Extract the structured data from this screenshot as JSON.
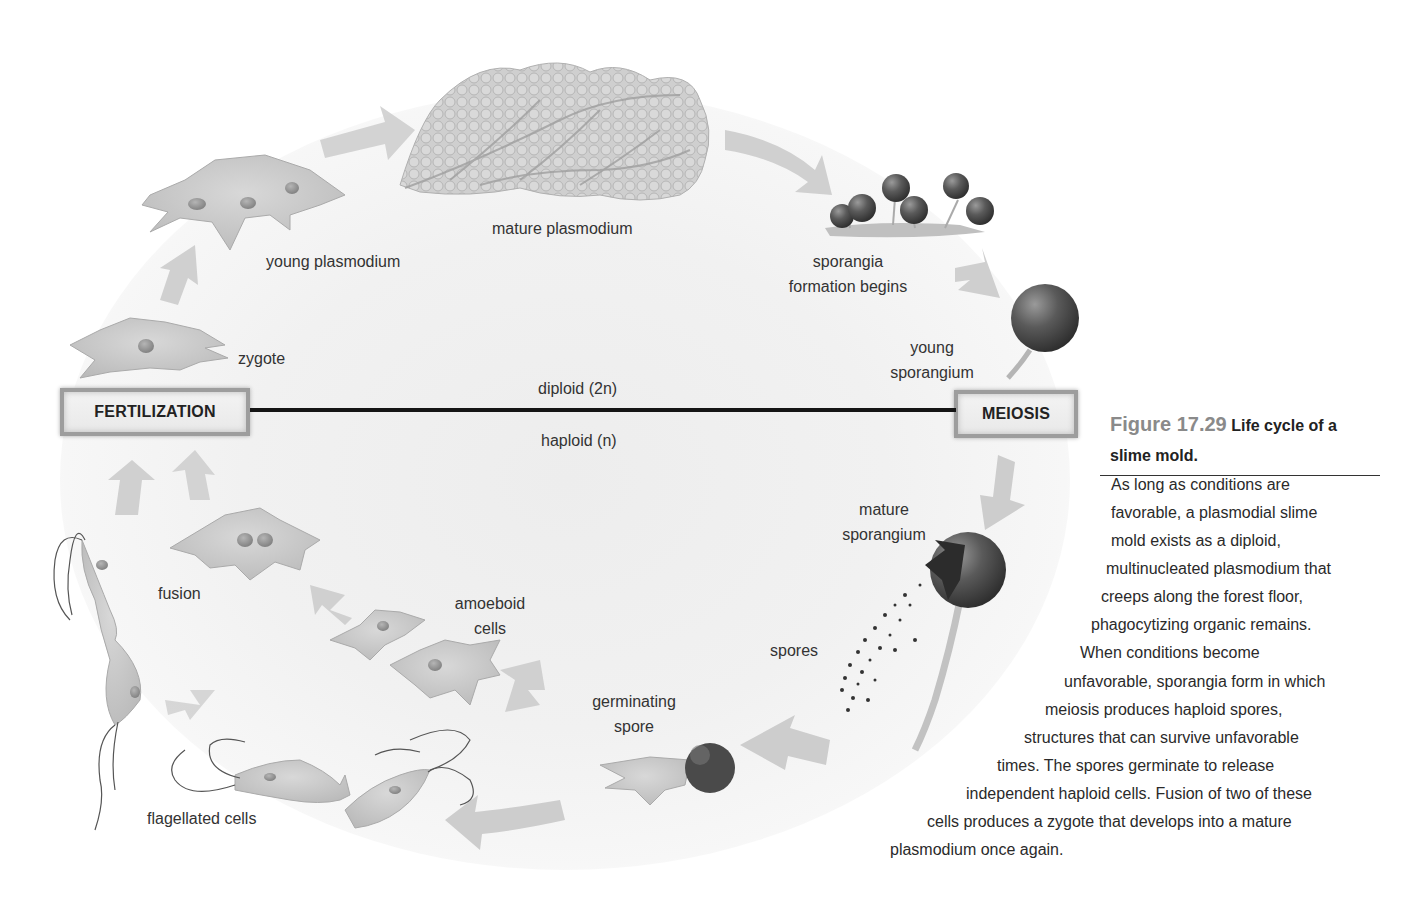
{
  "diagram": {
    "stages": {
      "fertilization": "FERTILIZATION",
      "meiosis": "MEIOSIS"
    },
    "ploidy": {
      "diploid": "diploid (2n)",
      "haploid": "haploid (n)"
    },
    "labels": {
      "young_plasmodium": "young plasmodium",
      "mature_plasmodium": "mature plasmodium",
      "sporangia_formation_1": "sporangia",
      "sporangia_formation_2": "formation begins",
      "young_sporangium_1": "young",
      "young_sporangium_2": "sporangium",
      "zygote": "zygote",
      "mature_sporangium_1": "mature",
      "mature_sporangium_2": "sporangium",
      "spores": "spores",
      "germinating_spore_1": "germinating",
      "germinating_spore_2": "spore",
      "amoeboid_cells_1": "amoeboid",
      "amoeboid_cells_2": "cells",
      "fusion": "fusion",
      "flagellated_cells": "flagellated cells"
    },
    "colors": {
      "arrow": "#d2d2d2",
      "cell": "#c9c9c9",
      "sporangium": "#555555",
      "line": "#151515",
      "box_border": "#9d9d9d"
    }
  },
  "caption": {
    "figure_number": "Figure 17.29",
    "title_line1": "Life cycle of a",
    "title_line2": "slime mold.",
    "lines": [
      "As long as conditions are",
      "favorable, a plasmodial slime",
      "mold exists as a diploid,",
      "multinucleated plasmodium that",
      "creeps along the forest floor,",
      "phagocytizing organic remains.",
      "When conditions become",
      "unfavorable, sporangia form in which",
      "meiosis produces haploid spores,",
      "structures that can survive unfavorable",
      "times. The spores germinate to release",
      "independent haploid cells. Fusion of two of these",
      "cells produces a zygote that develops into a mature",
      "plasmodium once again."
    ]
  }
}
